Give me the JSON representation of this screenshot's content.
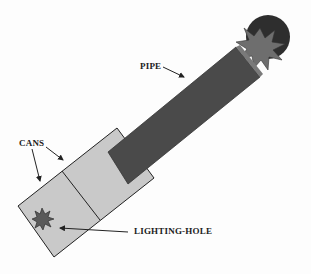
{
  "diagram": {
    "labels": {
      "pipe": "PIPE",
      "cans": "CANS",
      "lighting_hole": "LIGHTING-HOLE"
    },
    "colors": {
      "background": "#fdfdfd",
      "cans_fill": "#c9c9c9",
      "pipe_fill": "#4a4a4a",
      "ball_fill": "#2e2e2e",
      "star_fill": "#6e6e6e",
      "outline": "#222222"
    }
  }
}
